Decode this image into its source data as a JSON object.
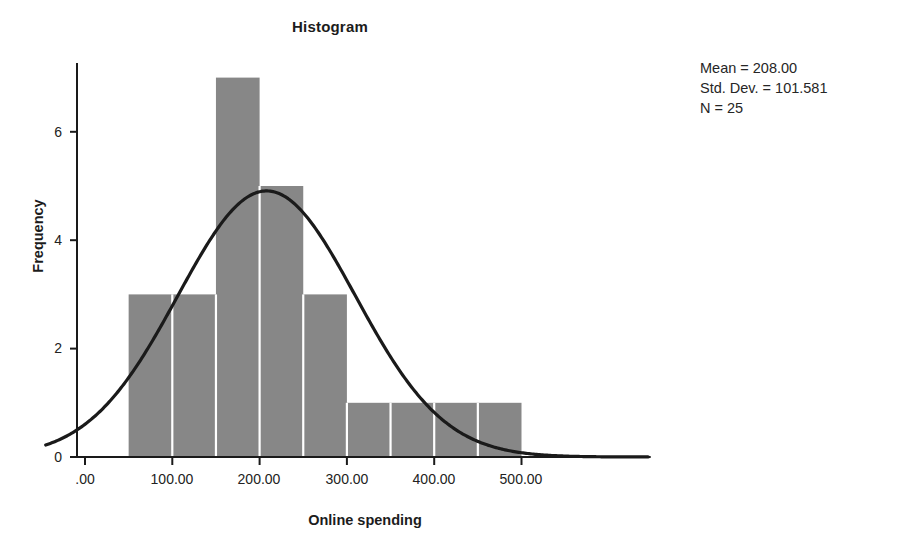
{
  "chart_data": {
    "type": "bar",
    "title": "Histogram",
    "xlabel": "Online spending",
    "ylabel": "Frequency",
    "categories": [
      "50-100",
      "100-150",
      "150-200",
      "200-250",
      "250-300",
      "300-350",
      "350-400",
      "400-450",
      "450-500"
    ],
    "bin_edges": [
      50,
      100,
      150,
      200,
      250,
      300,
      350,
      400,
      450,
      500
    ],
    "values": [
      3,
      3,
      7,
      5,
      3,
      1,
      1,
      1,
      1
    ],
    "xlim": [
      -50,
      550
    ],
    "ylim": [
      0,
      7.4
    ],
    "x_ticks": [
      0,
      100,
      200,
      300,
      400,
      500
    ],
    "x_tick_labels": [
      ".00",
      "100.00",
      "200.00",
      "300.00",
      "400.00",
      "500.00"
    ],
    "y_ticks": [
      0,
      2,
      4,
      6
    ],
    "y_tick_labels": [
      "0",
      "2",
      "4",
      "6"
    ],
    "grid": false,
    "legend_position": "top-right",
    "bar_color": "#878787",
    "bar_separator_color": "#ffffff",
    "curve_color": "#1a1a1a",
    "axis_color": "#1a1a1a",
    "normal_curve": {
      "shown": true,
      "mean": 208.0,
      "std_dev": 101.581,
      "n": 25,
      "bin_width": 50,
      "peak_value": 4.91
    },
    "annotations": {
      "mean_label": "Mean = 208.00",
      "std_dev_label": "Std. Dev. = 101.581",
      "n_label": "N = 25"
    }
  },
  "stats": {
    "mean": "Mean = 208.00",
    "std_dev": "Std. Dev. = 101.581",
    "n": "N = 25"
  },
  "axes": {
    "y_title": "Frequency",
    "x_title": "Online spending",
    "y_labels": [
      "0",
      "2",
      "4",
      "6"
    ],
    "x_labels": [
      ".00",
      "100.00",
      "200.00",
      "300.00",
      "400.00",
      "500.00"
    ]
  },
  "title": "Histogram"
}
